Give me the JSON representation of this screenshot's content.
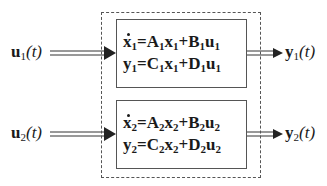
{
  "diagram": {
    "inputs": [
      {
        "id": "u1",
        "symbol": "u",
        "subscript": "1",
        "arg": "(t)"
      },
      {
        "id": "u2",
        "symbol": "u",
        "subscript": "2",
        "arg": "(t)"
      }
    ],
    "outputs": [
      {
        "id": "y1",
        "symbol": "y",
        "subscript": "1",
        "arg": "(t)"
      },
      {
        "id": "y2",
        "symbol": "y",
        "subscript": "2",
        "arg": "(t)"
      }
    ],
    "subsystems": [
      {
        "id": "subsystem-1",
        "state_eq": {
          "lhs": "x",
          "lhs_sub": "1",
          "eq": "=",
          "m1": "A",
          "m1_sub": "1",
          "v1": "x",
          "v1_sub": "1",
          "plus": "+",
          "m2": "B",
          "m2_sub": "1",
          "v2": "u",
          "v2_sub": "1"
        },
        "output_eq": {
          "lhs": "y",
          "lhs_sub": "1",
          "eq": "=",
          "m1": "C",
          "m1_sub": "1",
          "v1": "x",
          "v1_sub": "1",
          "plus": "+",
          "m2": "D",
          "m2_sub": "1",
          "v2": "u",
          "v2_sub": "1"
        }
      },
      {
        "id": "subsystem-2",
        "state_eq": {
          "lhs": "x",
          "lhs_sub": "2",
          "eq": "=",
          "m1": "A",
          "m1_sub": "2",
          "v1": "x",
          "v1_sub": "2",
          "plus": "+",
          "m2": "B",
          "m2_sub": "2",
          "v2": "u",
          "v2_sub": "2"
        },
        "output_eq": {
          "lhs": "y",
          "lhs_sub": "2",
          "eq": "=",
          "m1": "C",
          "m1_sub": "2",
          "v1": "x",
          "v1_sub": "2",
          "plus": "+",
          "m2": "D",
          "m2_sub": "2",
          "v2": "u",
          "v2_sub": "2"
        }
      }
    ],
    "colors": {
      "line": "#333333",
      "box_border": "#555555",
      "dashed_border": "#555555",
      "text": "#1a1a1a"
    }
  }
}
